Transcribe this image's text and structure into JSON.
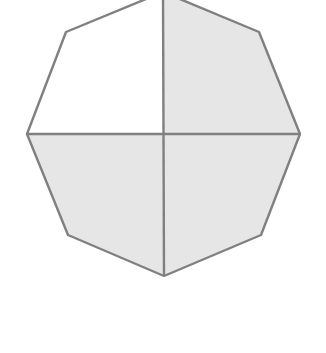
{
  "diagram": {
    "type": "fraction-octagon",
    "total_parts": 4,
    "shaded_parts": 3,
    "fraction_shaded": "3/4",
    "colors": {
      "shaded": "#e6e6e6",
      "unshaded": "#ffffff",
      "stroke": "#808080"
    },
    "quadrants": [
      {
        "position": "top-left",
        "shaded": false,
        "points": "163,134 27,134 66,32 163,-8"
      },
      {
        "position": "top-right",
        "shaded": true,
        "points": "163,134 163,-8 259,32 300,134"
      },
      {
        "position": "bottom-left",
        "shaded": true,
        "points": "163,134 27,134 68,235 164,276"
      },
      {
        "position": "bottom-right",
        "shaded": true,
        "points": "163,134 300,134 261,235 164,276"
      }
    ],
    "outline": "163,-8 259,32 300,134 261,235 164,276 68,235 27,134 66,32"
  }
}
